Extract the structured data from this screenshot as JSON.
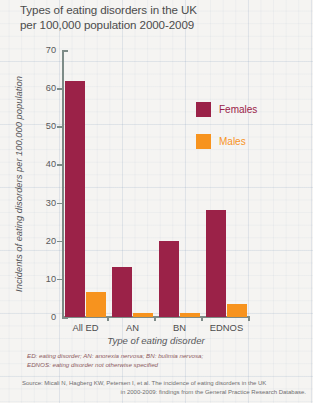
{
  "chart_data": {
    "type": "bar",
    "title": "Types of eating disorders in the UK per 100,000 population 2000-2009",
    "title_line1": "Types of eating disorders in the UK",
    "title_line2": "per 100,000 population 2000-2009",
    "xlabel": "Type of eating disorder",
    "ylabel": "Incidents of eating disorders per 100,000 population",
    "categories": [
      "All ED",
      "AN",
      "BN",
      "EDNOS"
    ],
    "series": [
      {
        "name": "Females",
        "color": "#9b2248",
        "values": [
          62,
          13,
          20,
          28
        ]
      },
      {
        "name": "Males",
        "color": "#f7931e",
        "values": [
          6.5,
          1,
          1,
          3.5
        ]
      }
    ],
    "ylim": [
      0,
      70
    ],
    "yticks": [
      0,
      10,
      20,
      30,
      40,
      50,
      60,
      70
    ],
    "grid": true,
    "legend_position": "inside-top-right"
  },
  "legend": {
    "items": [
      {
        "label": "Females",
        "color": "#9b2248"
      },
      {
        "label": "Males",
        "color": "#f7931e"
      }
    ]
  },
  "footnotes": {
    "abbreviations_line1": "ED: eating disorder; AN: anorexia nervosa; BN: bulimia nervosa;",
    "abbreviations_line2": "EDNOS: eating disorder not otherwise specified",
    "source_line1": "Source: Micali N, Hagberg KW, Petersen I, et al. The incidence of eating disorders in the UK",
    "source_line2": "in 2000-2009: findings from the General Practice Research Database."
  }
}
